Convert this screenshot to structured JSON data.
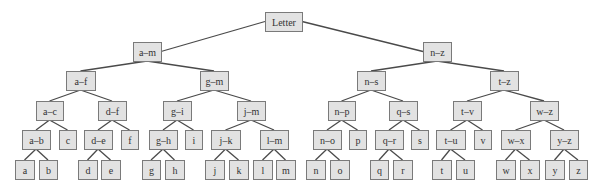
{
  "diagram": {
    "type": "binary-tree",
    "colors": {
      "node_fill": "#e2e2e2",
      "node_border": "#7a7a7a",
      "edge": "#4a4a4a",
      "text": "#333333"
    },
    "nodes": [
      {
        "id": "letter",
        "label": "Letter",
        "parent": null
      },
      {
        "id": "a-m",
        "label": "a–m",
        "parent": "letter"
      },
      {
        "id": "n-z",
        "label": "n–z",
        "parent": "letter"
      },
      {
        "id": "a-f",
        "label": "a–f",
        "parent": "a-m"
      },
      {
        "id": "g-m",
        "label": "g–m",
        "parent": "a-m"
      },
      {
        "id": "n-s",
        "label": "n–s",
        "parent": "n-z"
      },
      {
        "id": "t-z",
        "label": "t–z",
        "parent": "n-z"
      },
      {
        "id": "a-c",
        "label": "a–c",
        "parent": "a-f"
      },
      {
        "id": "d-f",
        "label": "d–f",
        "parent": "a-f"
      },
      {
        "id": "g-i",
        "label": "g–i",
        "parent": "g-m"
      },
      {
        "id": "j-m",
        "label": "j–m",
        "parent": "g-m"
      },
      {
        "id": "n-p",
        "label": "n–p",
        "parent": "n-s"
      },
      {
        "id": "q-s",
        "label": "q–s",
        "parent": "n-s"
      },
      {
        "id": "t-v",
        "label": "t–v",
        "parent": "t-z"
      },
      {
        "id": "w-z",
        "label": "w–z",
        "parent": "t-z"
      },
      {
        "id": "a-b",
        "label": "a–b",
        "parent": "a-c"
      },
      {
        "id": "c",
        "label": "c",
        "parent": "a-c"
      },
      {
        "id": "d-e",
        "label": "d–e",
        "parent": "d-f"
      },
      {
        "id": "f",
        "label": "f",
        "parent": "d-f"
      },
      {
        "id": "g-h",
        "label": "g–h",
        "parent": "g-i"
      },
      {
        "id": "i",
        "label": "i",
        "parent": "g-i"
      },
      {
        "id": "j-k",
        "label": "j–k",
        "parent": "j-m"
      },
      {
        "id": "l-m",
        "label": "l–m",
        "parent": "j-m"
      },
      {
        "id": "n-o",
        "label": "n–o",
        "parent": "n-p"
      },
      {
        "id": "p",
        "label": "p",
        "parent": "n-p"
      },
      {
        "id": "q-r",
        "label": "q–r",
        "parent": "q-s"
      },
      {
        "id": "s",
        "label": "s",
        "parent": "q-s"
      },
      {
        "id": "t-u",
        "label": "t–u",
        "parent": "t-v"
      },
      {
        "id": "v",
        "label": "v",
        "parent": "t-v"
      },
      {
        "id": "w-x",
        "label": "w–x",
        "parent": "w-z"
      },
      {
        "id": "y-z",
        "label": "y–z",
        "parent": "w-z"
      },
      {
        "id": "a",
        "label": "a",
        "parent": "a-b"
      },
      {
        "id": "b",
        "label": "b",
        "parent": "a-b"
      },
      {
        "id": "d",
        "label": "d",
        "parent": "d-e"
      },
      {
        "id": "e",
        "label": "e",
        "parent": "d-e"
      },
      {
        "id": "g",
        "label": "g",
        "parent": "g-h"
      },
      {
        "id": "h",
        "label": "h",
        "parent": "g-h"
      },
      {
        "id": "j",
        "label": "j",
        "parent": "j-k"
      },
      {
        "id": "k",
        "label": "k",
        "parent": "j-k"
      },
      {
        "id": "l",
        "label": "l",
        "parent": "l-m"
      },
      {
        "id": "m",
        "label": "m",
        "parent": "l-m"
      },
      {
        "id": "n",
        "label": "n",
        "parent": "n-o"
      },
      {
        "id": "o",
        "label": "o",
        "parent": "n-o"
      },
      {
        "id": "q",
        "label": "q",
        "parent": "q-r"
      },
      {
        "id": "r",
        "label": "r",
        "parent": "q-r"
      },
      {
        "id": "t",
        "label": "t",
        "parent": "t-u"
      },
      {
        "id": "u",
        "label": "u",
        "parent": "t-u"
      },
      {
        "id": "w",
        "label": "w",
        "parent": "w-x"
      },
      {
        "id": "x",
        "label": "x",
        "parent": "w-x"
      },
      {
        "id": "y",
        "label": "y",
        "parent": "y-z"
      },
      {
        "id": "z",
        "label": "z",
        "parent": "y-z"
      }
    ]
  }
}
